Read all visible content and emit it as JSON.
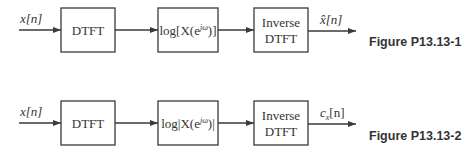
{
  "figures": [
    {
      "label": "Figure P13.13-1",
      "input_signal": "x[n]",
      "blocks": [
        {
          "label_lines": [
            "DTFT"
          ]
        },
        {
          "label_lines": [
            "log[X(e^{jω})]"
          ],
          "display": "log[X(e",
          "sup": "jω",
          "tail": ")]"
        },
        {
          "label_lines": [
            "Inverse",
            "DTFT"
          ]
        }
      ],
      "output_signal": "x̂[n]"
    },
    {
      "label": "Figure P13.13-2",
      "input_signal": "x[n]",
      "blocks": [
        {
          "label_lines": [
            "DTFT"
          ]
        },
        {
          "label_lines": [
            "log|X(e^{jω})|"
          ],
          "display": "log|X(e",
          "sup": "jω",
          "tail": ")|"
        },
        {
          "label_lines": [
            "Inverse",
            "DTFT"
          ]
        }
      ],
      "output_signal": "c_x[n]",
      "output_main": "c",
      "output_sub": "x",
      "output_tail": "[n]"
    }
  ],
  "colors": {
    "stroke": "#3a3a3a",
    "text": "#333333",
    "background": "#ffffff"
  }
}
